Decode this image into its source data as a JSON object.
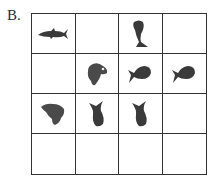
{
  "label": "B.",
  "grid": {
    "rows": 4,
    "cols": 4,
    "cells": [
      [
        "shark",
        "",
        "fish-vertical",
        ""
      ],
      [
        "",
        "bass-head",
        "whale-left",
        "whale-left"
      ],
      [
        "bass-head-side",
        "fish-vertical-tail-up",
        "fish-vertical-tail-up",
        ""
      ],
      [
        "",
        "",
        "",
        ""
      ]
    ]
  },
  "colors": {
    "line": "#333333",
    "icon": "#3a3a3a"
  }
}
